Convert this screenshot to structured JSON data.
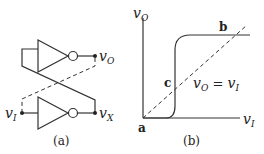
{
  "figure_a": {
    "caption": "(a)",
    "labels": {
      "vo_main": "v",
      "vo_sub": "O",
      "vx_main": "v",
      "vx_sub": "X",
      "vi_main": "v",
      "vi_sub": "I"
    },
    "components": [
      "inverter-top",
      "inverter-bottom"
    ]
  },
  "figure_b": {
    "caption": "(b)",
    "y_axis": {
      "main": "v",
      "sub": "O"
    },
    "x_axis": {
      "main": "v",
      "sub": "I"
    },
    "points": {
      "a": "a",
      "b": "b",
      "c": "c"
    },
    "line_label": {
      "left_main": "v",
      "left_sub": "O",
      "eq": " = ",
      "right_main": "v",
      "right_sub": "I"
    }
  }
}
